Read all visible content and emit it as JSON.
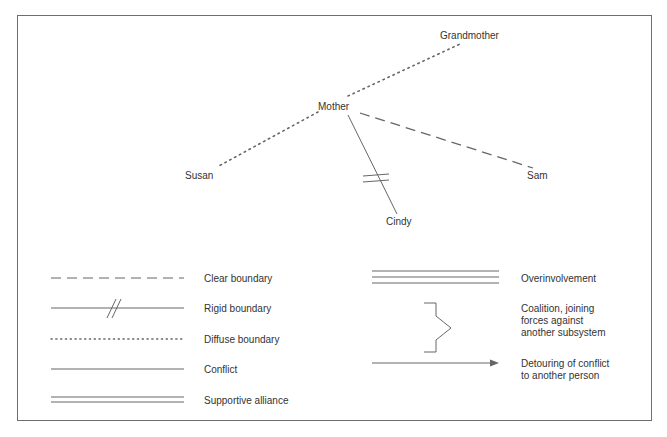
{
  "diagram": {
    "nodes": [
      {
        "id": "grandmother",
        "label": "Grandmother"
      },
      {
        "id": "mother",
        "label": "Mother"
      },
      {
        "id": "susan",
        "label": "Susan"
      },
      {
        "id": "sam",
        "label": "Sam"
      },
      {
        "id": "cindy",
        "label": "Cindy"
      }
    ],
    "edges": [
      {
        "from": "mother",
        "to": "grandmother",
        "type": "diffuse boundary"
      },
      {
        "from": "mother",
        "to": "susan",
        "type": "diffuse boundary"
      },
      {
        "from": "mother",
        "to": "sam",
        "type": "clear boundary"
      },
      {
        "from": "mother",
        "to": "cindy",
        "type": "rigid boundary"
      }
    ]
  },
  "legend": {
    "left": [
      {
        "symbol": "dashed-line",
        "label": "Clear boundary"
      },
      {
        "symbol": "line-with-double-slash",
        "label": "Rigid boundary"
      },
      {
        "symbol": "dotted-line",
        "label": "Diffuse boundary"
      },
      {
        "symbol": "solid-line",
        "label": "Conflict"
      },
      {
        "symbol": "double-line",
        "label": "Supportive alliance"
      }
    ],
    "right": [
      {
        "symbol": "triple-line",
        "label": "Overinvolvement"
      },
      {
        "symbol": "coalition-bracket",
        "label_lines": [
          "Coalition, joining",
          "forces against",
          "another subsystem"
        ]
      },
      {
        "symbol": "arrow",
        "label_lines": [
          "Detouring of conflict",
          "to another person"
        ]
      }
    ]
  },
  "colors": {
    "line": "#666666",
    "text": "#333333",
    "frame": "#6e6e6e"
  }
}
